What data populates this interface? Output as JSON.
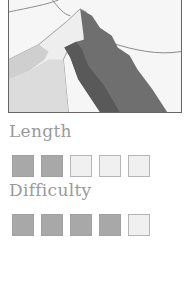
{
  "illustration": {
    "icon": "mountain-illustration",
    "colors": {
      "sky": "#f6f6f6",
      "light_face": "#efefef",
      "mid_face": "#c9c9c9",
      "dark_face": "#6f6f6f",
      "darker_face": "#5a5a5a",
      "outline": "#777777"
    }
  },
  "ratings": [
    {
      "label": "Length",
      "value": 2,
      "max": 5
    },
    {
      "label": "Difficulty",
      "value": 4,
      "max": 5
    }
  ],
  "colors": {
    "label": "#9a9a9a",
    "filled_box": "#a8a8a8",
    "empty_box": "#f0f0f0"
  }
}
